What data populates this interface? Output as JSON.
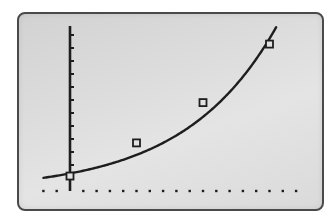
{
  "screen": {
    "description": "Graphing calculator display showing a scatter plot with an exponential regression curve",
    "frame_color": "#4a4a4a",
    "background_color": "#dcdcdc",
    "ink_color": "#1e1e1e"
  },
  "chart_data": {
    "type": "scatter",
    "title": "",
    "xlabel": "",
    "ylabel": "",
    "grid": false,
    "legend": null,
    "axes": {
      "x_axis_style": "dotted",
      "y_axis_style": "solid with tick marks",
      "x_tick_spacing_px": 13.3,
      "y_tick_spacing_px": 13,
      "y_tick_count": 12,
      "xlim": [
        -2,
        17
      ],
      "ylim": [
        0,
        12.5
      ]
    },
    "series": [
      {
        "name": "data points",
        "marker": "square",
        "x": [
          0,
          5,
          10,
          15
        ],
        "y": [
          1.15,
          3.7,
          6.8,
          11.3
        ]
      },
      {
        "name": "exponential regression curve",
        "marker": "none",
        "line": "solid",
        "model": "y = a*b^x",
        "a": 1.35,
        "b": 1.155,
        "x_range": [
          -2,
          15.5
        ]
      }
    ],
    "annotations": []
  }
}
